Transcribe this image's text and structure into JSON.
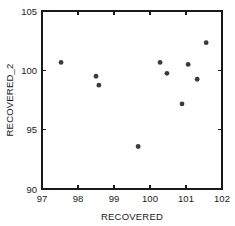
{
  "chart_data": {
    "type": "scatter",
    "title": "",
    "xlabel": "RECOVERED",
    "ylabel": "RECOVERED_2",
    "xlim": [
      97,
      102
    ],
    "ylim": [
      90,
      105
    ],
    "xticks": [
      97,
      98,
      99,
      100,
      101,
      102
    ],
    "yticks": [
      90,
      95,
      100,
      105
    ],
    "xtick_labels": [
      "97",
      "98",
      "99",
      "100",
      "101",
      "102"
    ],
    "ytick_labels": [
      "90",
      "95",
      "100",
      "105"
    ],
    "grid": false,
    "legend": null,
    "marker_color": "#3a3a3a",
    "axis_color": "#1a1a1a",
    "background_color": "#ffffff",
    "points": [
      {
        "x": 97.53,
        "y": 100.67
      },
      {
        "x": 98.5,
        "y": 99.5
      },
      {
        "x": 98.58,
        "y": 98.75
      },
      {
        "x": 99.67,
        "y": 93.58
      },
      {
        "x": 100.28,
        "y": 100.67
      },
      {
        "x": 100.47,
        "y": 99.75
      },
      {
        "x": 100.89,
        "y": 97.17
      },
      {
        "x": 101.06,
        "y": 100.5
      },
      {
        "x": 101.31,
        "y": 99.25
      },
      {
        "x": 101.56,
        "y": 102.33
      }
    ]
  },
  "figure": {
    "plot_left_px": 42,
    "plot_right_px": 222,
    "plot_top_px": 11,
    "plot_bottom_px": 189
  }
}
